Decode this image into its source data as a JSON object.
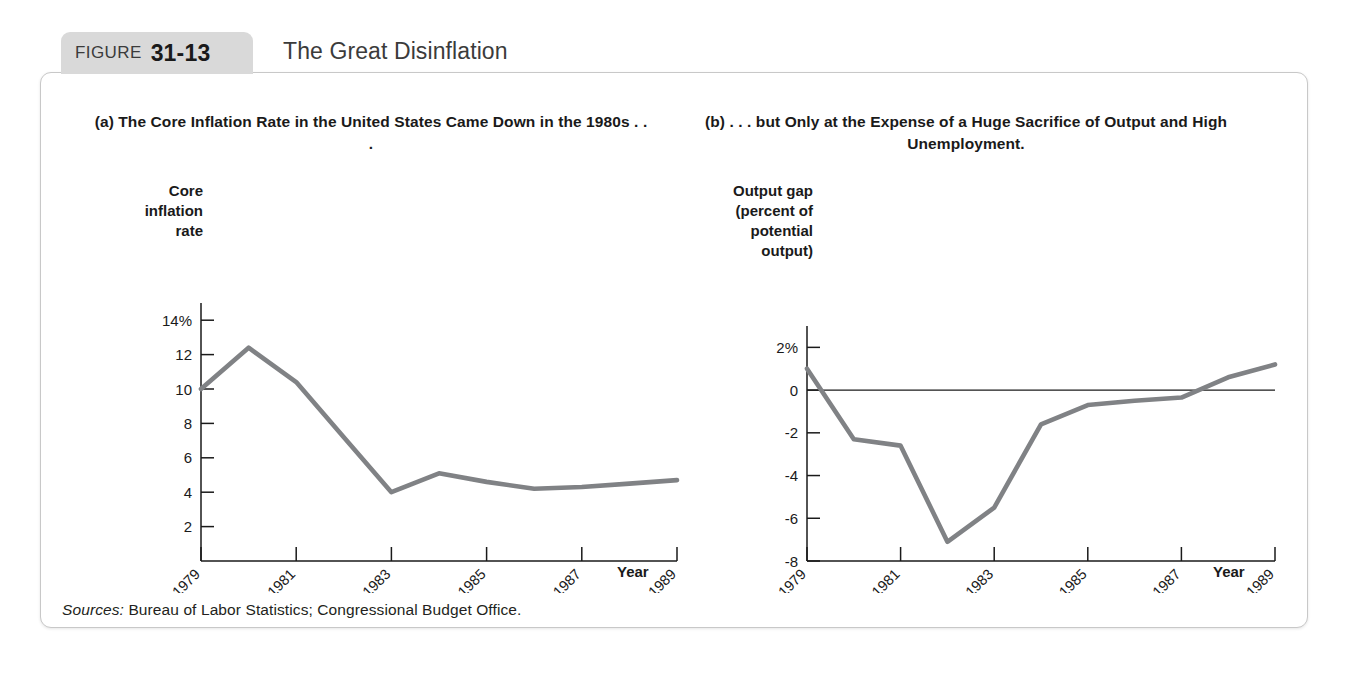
{
  "figure": {
    "label_word": "FIGURE",
    "number": "31-13",
    "heading": "The Great Disinflation",
    "sources_label": "Sources:",
    "sources_text": "Bureau of Labor Statistics; Congressional Budget Office."
  },
  "chart_data": [
    {
      "type": "line",
      "panel": "a",
      "title": "(a) The Core Inflation Rate in the United States\nCame Down in the 1980s . . .",
      "ylabel": "Core\ninflation\nrate",
      "xlabel": "Year",
      "x": [
        1979,
        1980,
        1981,
        1982,
        1983,
        1984,
        1985,
        1986,
        1987,
        1988,
        1989
      ],
      "values": [
        10.0,
        12.4,
        10.4,
        7.2,
        4.0,
        5.1,
        4.6,
        4.2,
        4.3,
        4.5,
        4.7
      ],
      "ytick_labels": [
        "14%",
        "12",
        "10",
        "8",
        "6",
        "4",
        "2"
      ],
      "ytick_values": [
        14,
        12,
        10,
        8,
        6,
        4,
        2
      ],
      "xtick_labels": [
        "1979",
        "1981",
        "1983",
        "1985",
        "1987",
        "1989"
      ],
      "xtick_values": [
        1979,
        1981,
        1983,
        1985,
        1987,
        1989
      ],
      "ylim": [
        0,
        15
      ],
      "xlim": [
        1979,
        1989
      ],
      "grid": false,
      "legend": "none",
      "line_color": "#808285"
    },
    {
      "type": "line",
      "panel": "b",
      "title": "(b) . . . but Only at the Expense of a Huge\nSacrifice of Output and High Unemployment.",
      "ylabel": "Output gap\n(percent of\npotential\noutput)",
      "xlabel": "Year",
      "x": [
        1979,
        1980,
        1981,
        1982,
        1983,
        1984,
        1985,
        1986,
        1987,
        1988,
        1989
      ],
      "values": [
        1.0,
        -2.3,
        -2.6,
        -7.1,
        -5.5,
        -1.6,
        -0.7,
        -0.5,
        -0.35,
        0.6,
        1.2
      ],
      "ytick_labels": [
        "2%",
        "0",
        "-2",
        "-4",
        "-6",
        "-8"
      ],
      "ytick_values": [
        2,
        0,
        -2,
        -4,
        -6,
        -8
      ],
      "xtick_labels": [
        "1979",
        "1981",
        "1983",
        "1985",
        "1987",
        "1989"
      ],
      "xtick_values": [
        1979,
        1981,
        1983,
        1985,
        1987,
        1989
      ],
      "ylim": [
        -8,
        3
      ],
      "xlim": [
        1979,
        1989
      ],
      "grid": false,
      "zero_line": true,
      "legend": "none",
      "line_color": "#808285"
    }
  ]
}
